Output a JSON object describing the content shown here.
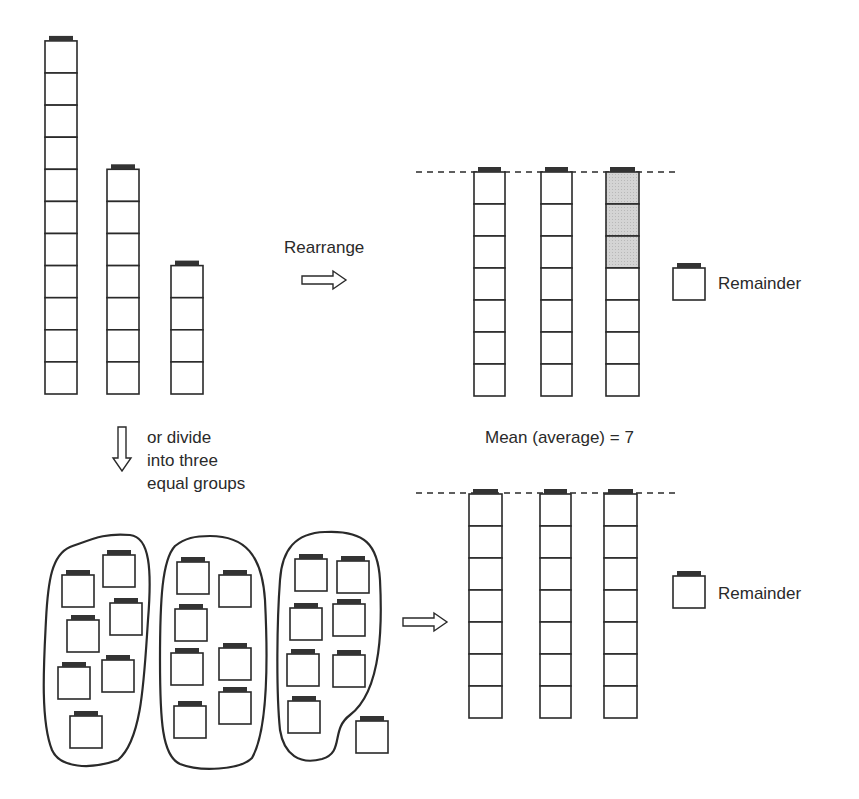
{
  "labels": {
    "rearrange": "Rearrange",
    "divide_line1": "or divide",
    "divide_line2": "into three",
    "divide_line3": "equal groups",
    "mean": "Mean (average) = 7",
    "remainder_top": "Remainder",
    "remainder_bottom": "Remainder"
  },
  "colors": {
    "stroke": "#2a2a2a",
    "cap": "#333333",
    "shaded": "#d4d4d4",
    "background": "#ffffff"
  },
  "towers_initial": [
    11,
    7,
    4
  ],
  "towers_rearranged": [
    7,
    7,
    7
  ],
  "shaded_cubes_in_third_tower": 3,
  "groups": [
    7,
    7,
    7
  ],
  "remainder": 1,
  "mean": 7
}
